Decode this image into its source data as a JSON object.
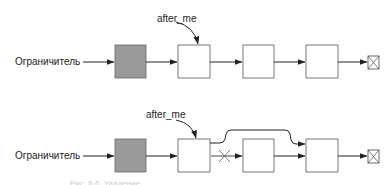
{
  "diagram": {
    "colors": {
      "line": "#222222",
      "node_border": "#555555",
      "sentinel_fill": "#9a9a9a",
      "node_fill": "#ffffff"
    },
    "top": {
      "head_label": "Ограничитель",
      "pointer_label": "after_me",
      "nodes": [
        "sentinel",
        "node",
        "node",
        "node",
        "null-terminator"
      ]
    },
    "bottom": {
      "head_label": "Ограничитель",
      "pointer_label": "after_me",
      "nodes": [
        "sentinel",
        "node",
        "node",
        "node",
        "null-terminator"
      ],
      "removed_link_mark": "×",
      "bypass_link": "after_me.next → node after removed"
    },
    "caption": "Рис. 6.6. Удаление..."
  }
}
